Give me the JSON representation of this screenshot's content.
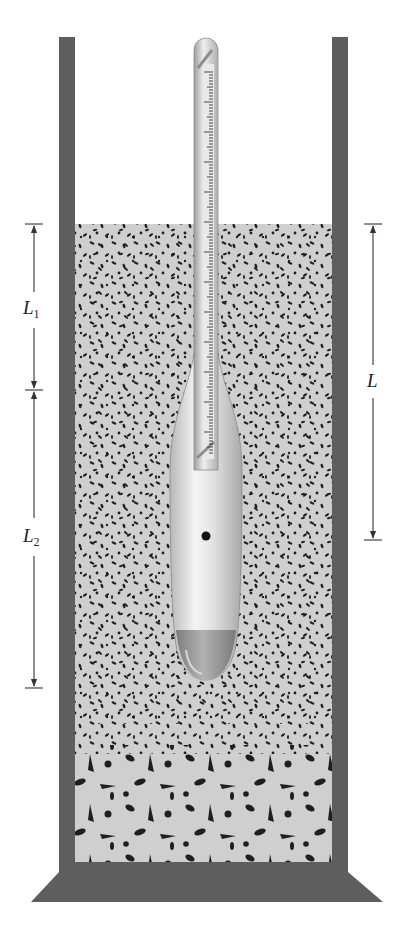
{
  "figure": {
    "colors": {
      "wall": "#5e5e5e",
      "liquid": "#cfcfcf",
      "particle": "#1e1e1e",
      "hydrometer_body": "#e6e6e6",
      "hydrometer_tip": "#9a9a9a",
      "dimension_line": "#333333"
    },
    "labels": {
      "L1": {
        "main": "L",
        "sub": "1"
      },
      "L2": {
        "main": "L",
        "sub": "2"
      },
      "L": {
        "main": "L",
        "sub": ""
      }
    },
    "dimensions": [
      {
        "name": "L1",
        "side": "left",
        "from_y": 225,
        "to_y": 390
      },
      {
        "name": "L2",
        "side": "left",
        "from_y": 390,
        "to_y": 688
      },
      {
        "name": "L",
        "side": "right",
        "from_y": 225,
        "to_y": 540
      }
    ],
    "components": [
      "cylinder",
      "soil-water suspension",
      "hydrometer stem with scale",
      "hydrometer bulb",
      "center of volume marker",
      "settled coarse particles",
      "base"
    ]
  }
}
